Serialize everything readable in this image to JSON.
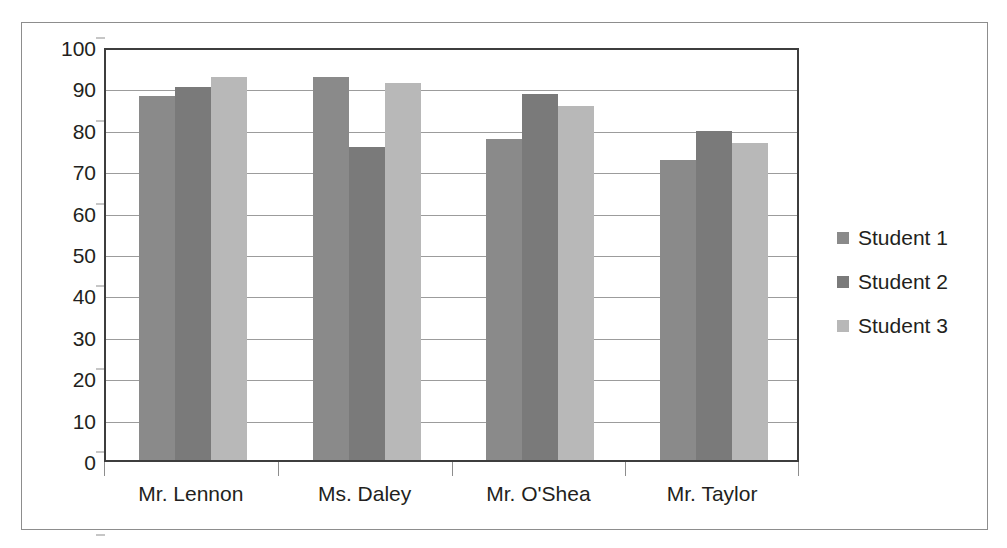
{
  "chart_data": {
    "type": "bar",
    "title": "",
    "subtitle": "",
    "xlabel": "",
    "ylabel": "",
    "categories": [
      "Mr. Lennon",
      "Ms. Daley",
      "Mr. O'Shea",
      "Mr. Taylor"
    ],
    "series": [
      {
        "name": "Student 1",
        "color": "#8a8a8a",
        "values": [
          88,
          92.5,
          77.5,
          72.5
        ]
      },
      {
        "name": "Student 2",
        "color": "#7a7a7a",
        "values": [
          90,
          75.5,
          88.5,
          79.5
        ]
      },
      {
        "name": "Student 3",
        "color": "#b8b8b8",
        "values": [
          92.5,
          91,
          85.5,
          76.5
        ]
      }
    ],
    "ylim": [
      0,
      100
    ],
    "ytick_step": 10,
    "yticks": [
      100,
      90,
      80,
      70,
      60,
      50,
      40,
      30,
      20,
      10,
      0
    ],
    "ytick_labels": [
      "100",
      "90",
      "80",
      "70",
      "60",
      "50",
      "40",
      "30",
      "20",
      "10",
      "0"
    ],
    "grid": true,
    "grid_axis": "y",
    "legend_position": "right",
    "legend": [
      "Student 1",
      "Student 2",
      "Student 3"
    ],
    "annotations": []
  },
  "colors": {
    "frame_border": "#8d8d8d",
    "plot_border": "#3d3d3d",
    "gridline": "#9c9c9c",
    "text": "#231f20",
    "background": "#ffffff"
  }
}
